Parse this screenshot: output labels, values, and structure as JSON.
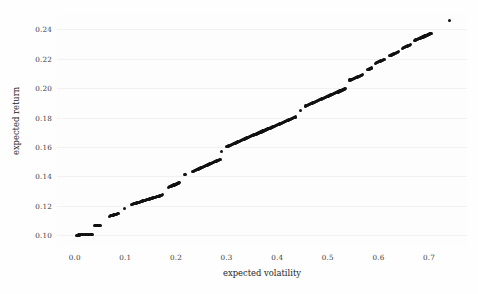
{
  "chart_data": {
    "type": "scatter",
    "title": "",
    "xlabel": "expected volatility",
    "ylabel": "expected return",
    "xlim": [
      -0.035,
      0.775
    ],
    "ylim": [
      0.0925,
      0.2505
    ],
    "xticks": [
      0.0,
      0.1,
      0.2,
      0.3,
      0.4,
      0.5,
      0.6,
      0.7
    ],
    "xticklabels": [
      "0.0",
      "0.1",
      "0.2",
      "0.3",
      "0.4",
      "0.5",
      "0.6",
      "0.7"
    ],
    "yticks": [
      0.1,
      0.12,
      0.14,
      0.16,
      0.18,
      0.2,
      0.22,
      0.24
    ],
    "yticklabels": [
      "0.10",
      "0.12",
      "0.14",
      "0.16",
      "0.18",
      "0.20",
      "0.22",
      "0.24"
    ],
    "grid": true,
    "legend": null,
    "marker_color": "#111111",
    "marker_size": 3.2,
    "background_color": "#fdfdfd",
    "gridline_color": "#f2f0f0",
    "series": [
      {
        "name": "portfolios",
        "x": [
          0.004,
          0.006,
          0.008,
          0.01,
          0.012,
          0.014,
          0.016,
          0.018,
          0.02,
          0.022,
          0.024,
          0.026,
          0.028,
          0.03,
          0.032,
          0.034,
          0.04,
          0.042,
          0.044,
          0.046,
          0.048,
          0.05,
          0.068,
          0.07,
          0.072,
          0.074,
          0.076,
          0.078,
          0.08,
          0.082,
          0.084,
          0.086,
          0.098,
          0.112,
          0.114,
          0.116,
          0.118,
          0.12,
          0.122,
          0.124,
          0.126,
          0.128,
          0.13,
          0.132,
          0.134,
          0.136,
          0.138,
          0.14,
          0.142,
          0.144,
          0.146,
          0.148,
          0.15,
          0.152,
          0.154,
          0.156,
          0.158,
          0.16,
          0.162,
          0.164,
          0.166,
          0.168,
          0.17,
          0.172,
          0.174,
          0.186,
          0.188,
          0.19,
          0.192,
          0.194,
          0.196,
          0.198,
          0.2,
          0.202,
          0.204,
          0.206,
          0.218,
          0.232,
          0.234,
          0.236,
          0.238,
          0.24,
          0.242,
          0.244,
          0.246,
          0.248,
          0.25,
          0.252,
          0.254,
          0.256,
          0.258,
          0.26,
          0.262,
          0.264,
          0.266,
          0.268,
          0.27,
          0.272,
          0.274,
          0.276,
          0.278,
          0.28,
          0.282,
          0.284,
          0.286,
          0.288,
          0.29,
          0.3,
          0.302,
          0.304,
          0.306,
          0.308,
          0.31,
          0.312,
          0.314,
          0.316,
          0.318,
          0.32,
          0.322,
          0.324,
          0.326,
          0.328,
          0.33,
          0.332,
          0.334,
          0.336,
          0.338,
          0.34,
          0.342,
          0.344,
          0.346,
          0.348,
          0.35,
          0.352,
          0.354,
          0.356,
          0.358,
          0.36,
          0.362,
          0.364,
          0.366,
          0.368,
          0.37,
          0.372,
          0.374,
          0.376,
          0.378,
          0.38,
          0.382,
          0.384,
          0.386,
          0.388,
          0.39,
          0.392,
          0.394,
          0.396,
          0.398,
          0.4,
          0.402,
          0.404,
          0.406,
          0.408,
          0.41,
          0.412,
          0.414,
          0.416,
          0.418,
          0.42,
          0.422,
          0.424,
          0.426,
          0.428,
          0.43,
          0.432,
          0.434,
          0.436,
          0.446,
          0.456,
          0.458,
          0.46,
          0.462,
          0.464,
          0.466,
          0.468,
          0.47,
          0.472,
          0.474,
          0.476,
          0.478,
          0.48,
          0.482,
          0.484,
          0.486,
          0.488,
          0.49,
          0.492,
          0.494,
          0.496,
          0.498,
          0.5,
          0.502,
          0.504,
          0.506,
          0.508,
          0.51,
          0.512,
          0.514,
          0.516,
          0.518,
          0.52,
          0.522,
          0.524,
          0.526,
          0.528,
          0.53,
          0.532,
          0.534,
          0.544,
          0.546,
          0.548,
          0.55,
          0.552,
          0.554,
          0.556,
          0.558,
          0.56,
          0.562,
          0.564,
          0.566,
          0.568,
          0.578,
          0.58,
          0.582,
          0.584,
          0.586,
          0.594,
          0.596,
          0.598,
          0.6,
          0.602,
          0.604,
          0.606,
          0.608,
          0.61,
          0.612,
          0.622,
          0.624,
          0.626,
          0.628,
          0.63,
          0.632,
          0.634,
          0.636,
          0.638,
          0.64,
          0.648,
          0.65,
          0.652,
          0.654,
          0.656,
          0.658,
          0.66,
          0.662,
          0.664,
          0.672,
          0.674,
          0.676,
          0.678,
          0.68,
          0.682,
          0.684,
          0.686,
          0.688,
          0.69,
          0.692,
          0.694,
          0.696,
          0.698,
          0.7,
          0.702,
          0.704,
          0.74
        ],
        "y": [
          0.0999,
          0.0999,
          0.1,
          0.1,
          0.1001,
          0.1001,
          0.1002,
          0.1002,
          0.1003,
          0.1003,
          0.1004,
          0.1004,
          0.1005,
          0.1005,
          0.1006,
          0.1006,
          0.1062,
          0.1063,
          0.1064,
          0.1065,
          0.1066,
          0.1067,
          0.1128,
          0.113,
          0.1132,
          0.1134,
          0.1136,
          0.1138,
          0.114,
          0.1142,
          0.1144,
          0.1146,
          0.1178,
          0.1208,
          0.121,
          0.1212,
          0.1214,
          0.1216,
          0.1218,
          0.122,
          0.1222,
          0.1224,
          0.1226,
          0.1229,
          0.1231,
          0.1233,
          0.1235,
          0.1237,
          0.1239,
          0.1241,
          0.1243,
          0.1245,
          0.1247,
          0.125,
          0.1252,
          0.1254,
          0.1256,
          0.1258,
          0.126,
          0.1262,
          0.1264,
          0.1266,
          0.1268,
          0.1271,
          0.1273,
          0.1325,
          0.1328,
          0.1331,
          0.1334,
          0.1337,
          0.134,
          0.1343,
          0.1346,
          0.1349,
          0.1352,
          0.1355,
          0.1413,
          0.1432,
          0.1435,
          0.1438,
          0.1441,
          0.1444,
          0.1447,
          0.145,
          0.1453,
          0.1456,
          0.1459,
          0.1462,
          0.1465,
          0.1468,
          0.1471,
          0.1474,
          0.1477,
          0.148,
          0.1483,
          0.1486,
          0.1489,
          0.1492,
          0.1495,
          0.1498,
          0.1501,
          0.1504,
          0.1507,
          0.151,
          0.1513,
          0.1516,
          0.1567,
          0.16,
          0.1603,
          0.1606,
          0.1609,
          0.1612,
          0.1615,
          0.1618,
          0.1621,
          0.1624,
          0.1627,
          0.163,
          0.1633,
          0.1636,
          0.1639,
          0.1642,
          0.1645,
          0.1648,
          0.1651,
          0.1654,
          0.1657,
          0.166,
          0.1663,
          0.1666,
          0.1669,
          0.1672,
          0.1675,
          0.1678,
          0.1681,
          0.1684,
          0.1687,
          0.169,
          0.1693,
          0.1696,
          0.1699,
          0.1702,
          0.1705,
          0.1708,
          0.1711,
          0.1714,
          0.1717,
          0.172,
          0.1723,
          0.1726,
          0.1729,
          0.1732,
          0.1735,
          0.1738,
          0.1741,
          0.1744,
          0.1747,
          0.175,
          0.1753,
          0.1756,
          0.1759,
          0.1762,
          0.1765,
          0.1768,
          0.1771,
          0.1774,
          0.1777,
          0.178,
          0.1783,
          0.1786,
          0.1789,
          0.1792,
          0.1795,
          0.1798,
          0.1801,
          0.1804,
          0.185,
          0.1878,
          0.1881,
          0.1884,
          0.1887,
          0.189,
          0.1893,
          0.1896,
          0.1899,
          0.1902,
          0.1905,
          0.1908,
          0.1911,
          0.1914,
          0.1917,
          0.192,
          0.1923,
          0.1926,
          0.1929,
          0.1932,
          0.1935,
          0.1938,
          0.1941,
          0.1944,
          0.1947,
          0.195,
          0.1953,
          0.1956,
          0.1959,
          0.1962,
          0.1965,
          0.1968,
          0.1971,
          0.1974,
          0.1977,
          0.198,
          0.1983,
          0.1986,
          0.1989,
          0.1992,
          0.1995,
          0.2055,
          0.2058,
          0.2061,
          0.2064,
          0.2067,
          0.207,
          0.2073,
          0.2076,
          0.2079,
          0.2082,
          0.2085,
          0.2088,
          0.2091,
          0.2125,
          0.2128,
          0.2131,
          0.2134,
          0.2137,
          0.217,
          0.2173,
          0.2176,
          0.2179,
          0.2182,
          0.2185,
          0.2188,
          0.2191,
          0.2194,
          0.2197,
          0.222,
          0.2223,
          0.2226,
          0.2229,
          0.2232,
          0.2235,
          0.2238,
          0.2241,
          0.2244,
          0.2247,
          0.2272,
          0.2275,
          0.2278,
          0.2281,
          0.2284,
          0.2287,
          0.229,
          0.2293,
          0.2296,
          0.2325,
          0.2328,
          0.2331,
          0.2334,
          0.2337,
          0.234,
          0.2343,
          0.2346,
          0.2349,
          0.2352,
          0.2355,
          0.2358,
          0.2361,
          0.2364,
          0.2367,
          0.237,
          0.2373,
          0.2462
        ]
      }
    ]
  }
}
